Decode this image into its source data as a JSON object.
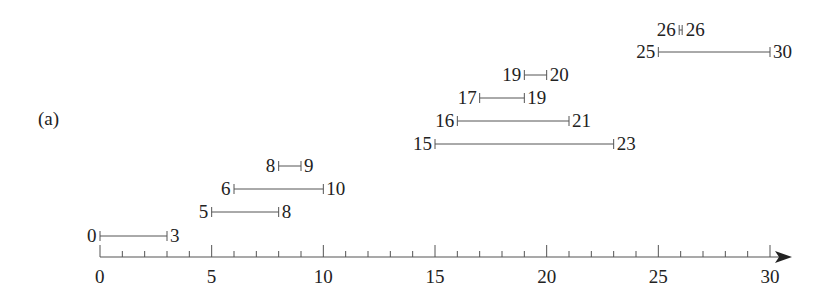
{
  "panel_label": "(a)",
  "axis": {
    "min": 0,
    "max": 30,
    "major_ticks": [
      0,
      5,
      10,
      15,
      20,
      25,
      30
    ],
    "major_tick_labels": [
      "0",
      "5",
      "10",
      "15",
      "20",
      "25",
      "30"
    ],
    "minor_tick_step": 1,
    "arrow": true
  },
  "intervals": [
    {
      "start": 0,
      "end": 3,
      "start_label": "0",
      "end_label": "3"
    },
    {
      "start": 5,
      "end": 8,
      "start_label": "5",
      "end_label": "8"
    },
    {
      "start": 6,
      "end": 10,
      "start_label": "6",
      "end_label": "10"
    },
    {
      "start": 8,
      "end": 9,
      "start_label": "8",
      "end_label": "9"
    },
    {
      "start": 15,
      "end": 23,
      "start_label": "15",
      "end_label": "23"
    },
    {
      "start": 16,
      "end": 21,
      "start_label": "16",
      "end_label": "21"
    },
    {
      "start": 17,
      "end": 19,
      "start_label": "17",
      "end_label": "19"
    },
    {
      "start": 19,
      "end": 20,
      "start_label": "19",
      "end_label": "20"
    },
    {
      "start": 25,
      "end": 30,
      "start_label": "25",
      "end_label": "30"
    },
    {
      "start": 26,
      "end": 26,
      "start_label": "26",
      "end_label": "26"
    }
  ],
  "colors": {
    "line": "#555555",
    "text": "#222222",
    "background": "#ffffff"
  }
}
